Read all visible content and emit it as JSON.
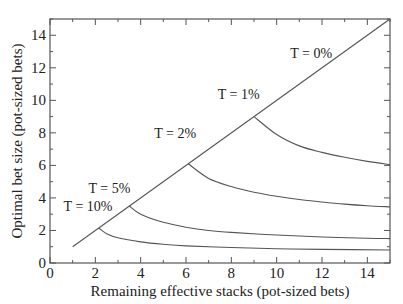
{
  "chart_data": {
    "type": "line",
    "title": "",
    "xlabel": "Remaining effective stacks (pot-sized bets)",
    "ylabel": "Optimal bet size (pot-sized bets)",
    "xlim": [
      0,
      15
    ],
    "ylim": [
      0,
      15
    ],
    "xticks": [
      0,
      2,
      4,
      6,
      8,
      10,
      12,
      14
    ],
    "yticks": [
      0,
      2,
      4,
      6,
      8,
      10,
      12,
      14
    ],
    "grid": false,
    "legend": "inline labels",
    "series": [
      {
        "name": "T = 0%",
        "x": [
          1,
          15
        ],
        "y": [
          1,
          15
        ]
      },
      {
        "name": "T = 1%",
        "x": [
          9,
          10,
          11,
          12,
          13,
          14,
          15
        ],
        "y": [
          9,
          7.9,
          7.2,
          6.8,
          6.5,
          6.25,
          6.05
        ]
      },
      {
        "name": "T = 2%",
        "x": [
          6.1,
          7,
          8,
          9,
          10,
          11,
          12,
          13,
          14,
          15
        ],
        "y": [
          6.1,
          5.2,
          4.7,
          4.35,
          4.1,
          3.9,
          3.75,
          3.62,
          3.52,
          3.45
        ]
      },
      {
        "name": "T = 5%",
        "x": [
          3.5,
          4,
          5,
          6,
          7,
          8,
          10,
          12,
          14,
          15
        ],
        "y": [
          3.5,
          3.0,
          2.5,
          2.2,
          2.0,
          1.88,
          1.72,
          1.6,
          1.52,
          1.5
        ]
      },
      {
        "name": "T = 10%",
        "x": [
          2.15,
          2.5,
          3,
          4,
          5,
          6,
          8,
          10,
          12,
          15
        ],
        "y": [
          2.15,
          1.8,
          1.55,
          1.3,
          1.15,
          1.05,
          0.95,
          0.88,
          0.84,
          0.8
        ]
      }
    ],
    "annotations": [
      {
        "text": "T = 0%",
        "x": 10.6,
        "y": 12.6
      },
      {
        "text": "T = 1%",
        "x": 7.4,
        "y": 10.1
      },
      {
        "text": "T = 2%",
        "x": 4.6,
        "y": 7.7
      },
      {
        "text": "T = 5%",
        "x": 1.7,
        "y": 4.3
      },
      {
        "text": "T = 10%",
        "x": 0.6,
        "y": 3.2
      }
    ]
  }
}
